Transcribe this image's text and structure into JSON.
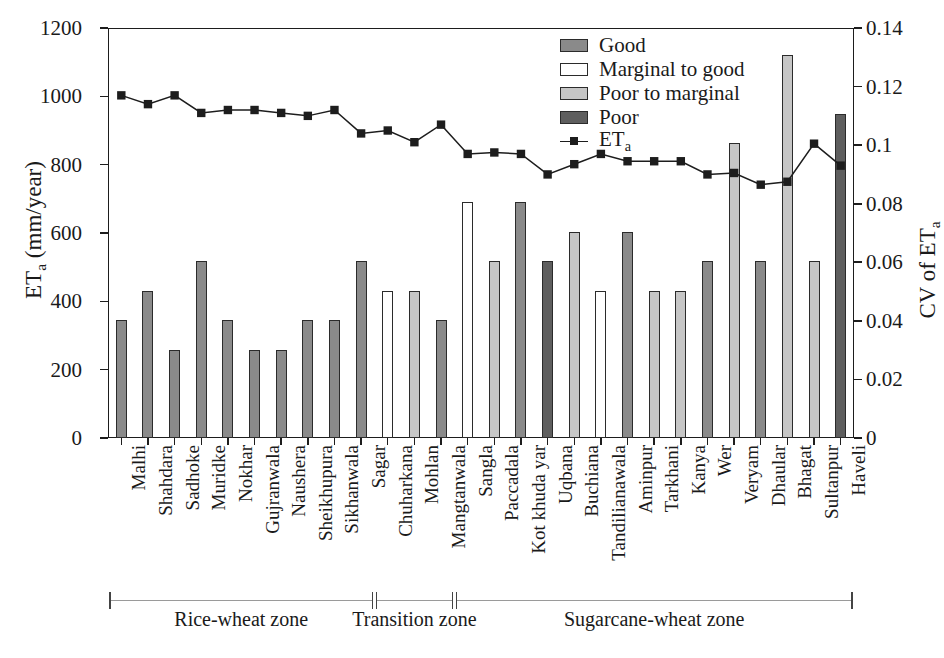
{
  "chart_data": {
    "type": "bar",
    "title": "",
    "xlabel": "",
    "ylabel": "ET_a (mm/year)",
    "ylabel_main": "ET",
    "ylabel_sub": "a",
    "ylabel_unit": " (mm/year)",
    "y2label_main": "CV of ET",
    "y2label_sub": "a",
    "ylim": [
      0,
      1200
    ],
    "yticks": [
      0,
      200,
      400,
      600,
      800,
      1000,
      1200
    ],
    "ytick_labels": [
      "0",
      "200",
      "400",
      "600",
      "800",
      "1000",
      "1200"
    ],
    "y2lim": [
      0,
      0.14
    ],
    "y2ticks": [
      0,
      0.02,
      0.04,
      0.06,
      0.08,
      0.1,
      0.12,
      0.14
    ],
    "y2tick_labels": [
      "0",
      "0.02",
      "0.04",
      "0.06",
      "0.08",
      "0.1",
      "0.12",
      "0.14"
    ],
    "grid": false,
    "legend_position": "top-center-right",
    "categories": [
      "Malhi",
      "Shahdara",
      "Sadhoke",
      "Muridke",
      "Nokhar",
      "Gujranwala",
      "Naushera",
      "Sheikhupura",
      "Sikhanwala",
      "Sagar",
      "Chuharkana",
      "Mohlan",
      "Mangtanwala",
      "Sangla",
      "Paccadala",
      "Kot khuda yar",
      "Uqbana",
      "Buchiana",
      "Tandilianawala",
      "Aminpur",
      "Tarkhani",
      "Kanya",
      "Wer",
      "Veryam",
      "Dhaular",
      "Bhagat",
      "Sultanpur",
      "Haveli"
    ],
    "bar_series_name": "ET_a (mm/year)",
    "values": [
      345,
      430,
      258,
      517,
      345,
      258,
      258,
      345,
      345,
      517,
      430,
      430,
      345,
      690,
      517,
      690,
      517,
      603,
      430,
      603,
      430,
      430,
      517,
      862,
      517,
      1120,
      517,
      948
    ],
    "classes": [
      "Good",
      "Good",
      "Good",
      "Good",
      "Good",
      "Good",
      "Good",
      "Good",
      "Good",
      "Good",
      "Marginal to good",
      "Poor to marginal",
      "Good",
      "Marginal to good",
      "Poor to marginal",
      "Good",
      "Poor",
      "Poor to marginal",
      "Marginal to good",
      "Good",
      "Poor to marginal",
      "Poor to marginal",
      "Good",
      "Poor to marginal",
      "Good",
      "Poor to marginal",
      "Poor to marginal",
      "Poor"
    ],
    "line_series_name": "ET_a",
    "line_values_cv": [
      0.117,
      0.114,
      0.117,
      0.111,
      0.112,
      0.112,
      0.111,
      0.11,
      0.112,
      0.104,
      0.105,
      0.101,
      0.107,
      0.097,
      0.0975,
      0.097,
      0.09,
      0.0935,
      0.097,
      0.0945,
      0.0945,
      0.0945,
      0.09,
      0.0905,
      0.0865,
      0.0875,
      0.1005,
      0.093
    ],
    "zones": [
      {
        "label": "Rice-wheat zone",
        "start": 0,
        "end": 9
      },
      {
        "label": "Transition zone",
        "start": 10,
        "end": 12
      },
      {
        "label": "Sugarcane-wheat zone",
        "start": 13,
        "end": 27
      }
    ]
  },
  "legend": {
    "items": [
      {
        "label": "Good",
        "color": "#8a8a8a",
        "kind": "bar"
      },
      {
        "label": "Marginal to good",
        "color": "#ffffff",
        "kind": "bar"
      },
      {
        "label": "Poor to marginal",
        "color": "#c6c6c6",
        "kind": "bar"
      },
      {
        "label": "Poor",
        "color": "#5e5e5e",
        "kind": "bar"
      },
      {
        "label": "ET",
        "sub": "a",
        "color": "#1d1d1d",
        "kind": "line"
      }
    ]
  },
  "colors": {
    "good": "#8a8a8a",
    "marginal_to_good": "#ffffff",
    "poor_to_marginal": "#c6c6c6",
    "poor": "#5e5e5e",
    "line": "#1d1d1d",
    "axis": "#1d1d1d",
    "background": "#ffffff"
  }
}
